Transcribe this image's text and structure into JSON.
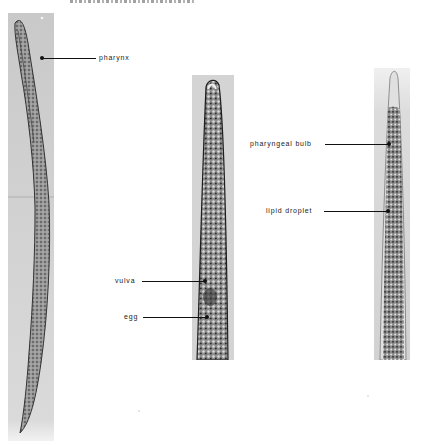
{
  "figure": {
    "clipped_header": "",
    "panels": [
      {
        "id": "whole-body",
        "description": "full-length nematode micrograph",
        "labels": [
          {
            "text": "pharynx"
          }
        ]
      },
      {
        "id": "anterior-female",
        "description": "anterior region micrograph",
        "labels": [
          {
            "text": "vulva"
          },
          {
            "text": "egg"
          }
        ]
      },
      {
        "id": "anterior-juvenile",
        "description": "anterior region micrograph",
        "labels": [
          {
            "text": "pharyngeal bulb"
          },
          {
            "text": "lipid droplet"
          }
        ]
      }
    ]
  },
  "colors": {
    "background": "#ffffff",
    "panel_bg": "#cfcfcf",
    "label_text": "#222222",
    "leader_line": "#111111"
  }
}
